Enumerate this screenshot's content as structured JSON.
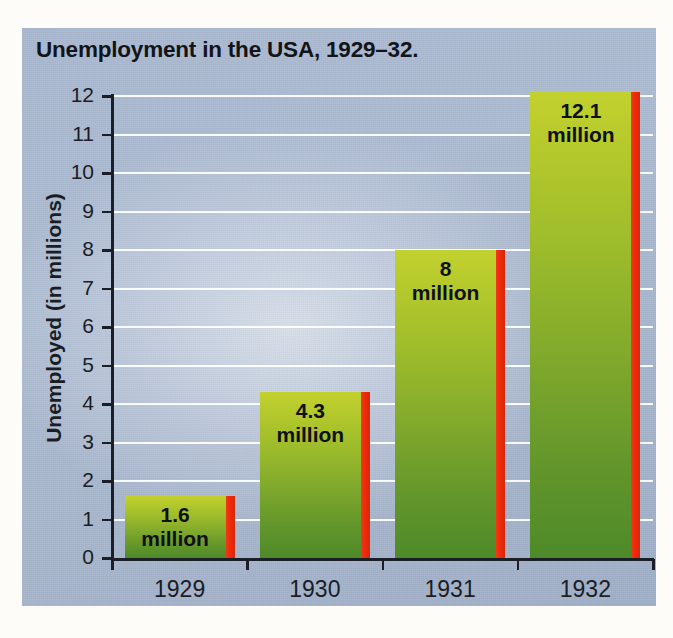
{
  "chart_data": {
    "type": "bar",
    "title": "Unemployment in the USA, 1929–32.",
    "xlabel": "",
    "ylabel": "Unemployed (in millions)",
    "categories": [
      "1929",
      "1930",
      "1931",
      "1932"
    ],
    "values": [
      1.6,
      4.3,
      8,
      12.1
    ],
    "point_labels": [
      "1.6 million",
      "4.3 million",
      "8 million",
      "12.1 million"
    ],
    "point_label_lines": [
      [
        "1.6",
        "million"
      ],
      [
        "4.3",
        "million"
      ],
      [
        "8",
        "million"
      ],
      [
        "12.1",
        "million"
      ]
    ],
    "ylim": [
      0,
      12
    ],
    "ytick_labels": [
      "0",
      "1",
      "2",
      "3",
      "4",
      "5",
      "6",
      "7",
      "8",
      "9",
      "10",
      "11",
      "12"
    ],
    "ytick_values": [
      0,
      1,
      2,
      3,
      4,
      5,
      6,
      7,
      8,
      9,
      10,
      11,
      12
    ],
    "grid": true,
    "grid_axis": "y",
    "legend": false,
    "legend_position": "none",
    "series": [
      {
        "name": "Unemployed (in millions)",
        "values": [
          1.6,
          4.3,
          8,
          12.1
        ]
      }
    ],
    "colors": {
      "bar_top": "#c2d12e",
      "bar_bottom": "#4e8a29",
      "bar_edge_stripe": "#ee2a0c",
      "panel_background": "#acbbd2",
      "gridline": "#ffffff",
      "axis": "#1b1e26",
      "text": "#1a1d24",
      "page_background": "#fdfcf8"
    }
  }
}
